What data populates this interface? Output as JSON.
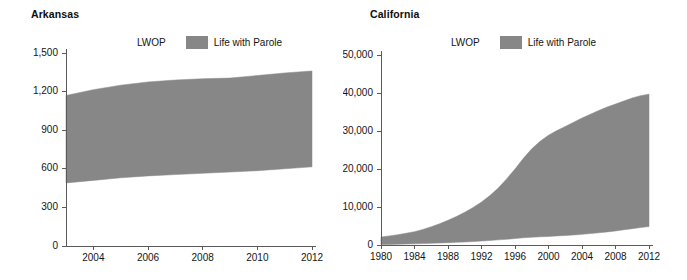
{
  "figure": {
    "background": "#ffffff",
    "series_color": "#878787",
    "axis_color": "#5a5a5a",
    "text_color": "#141414"
  },
  "panels": [
    {
      "id": "arkansas",
      "title": "Arkansas",
      "legend": {
        "lwop_label": "LWOP",
        "parole_label": "Life with Parole",
        "swatch_color": "#878787"
      }
    },
    {
      "id": "california",
      "title": "California",
      "legend": {
        "lwop_label": "LWOP",
        "parole_label": "Life with Parole",
        "swatch_color": "#878787"
      }
    }
  ],
  "chart_data": [
    {
      "type": "area",
      "title": "Arkansas",
      "xlabel": "",
      "ylabel": "",
      "grid": false,
      "legend_position": "top",
      "legend": [
        "LWOP",
        "Life with Parole"
      ],
      "series_color": "#878787",
      "xlim": [
        2003,
        2012
      ],
      "ylim": [
        0,
        1500
      ],
      "ytick_labels": [
        "0",
        "300",
        "600",
        "900",
        "1,200",
        "1,500"
      ],
      "ytick_values": [
        0,
        300,
        600,
        900,
        1200,
        1500
      ],
      "xtick_labels": [
        "2004",
        "2006",
        "2008",
        "2010",
        "2012"
      ],
      "xtick_values": [
        2004,
        2006,
        2008,
        2010,
        2012
      ],
      "x": [
        2003,
        2004,
        2005,
        2006,
        2007,
        2008,
        2009,
        2010,
        2011,
        2012
      ],
      "series": [
        {
          "name": "LWOP",
          "note": "lower boundary of shaded band; LWOP count",
          "values": [
            490,
            510,
            530,
            545,
            555,
            565,
            575,
            585,
            600,
            615
          ]
        },
        {
          "name": "Life with Parole",
          "note": "upper boundary of shaded band; LWOP + Life with Parole total",
          "values": [
            1170,
            1215,
            1250,
            1275,
            1290,
            1300,
            1305,
            1325,
            1345,
            1360
          ]
        }
      ]
    },
    {
      "type": "area",
      "title": "California",
      "xlabel": "",
      "ylabel": "",
      "grid": false,
      "legend_position": "top",
      "legend": [
        "LWOP",
        "Life with Parole"
      ],
      "series_color": "#878787",
      "xlim": [
        1980,
        2012
      ],
      "ylim": [
        0,
        50000
      ],
      "ytick_labels": [
        "0",
        "10,000",
        "20,000",
        "30,000",
        "40,000",
        "50,000"
      ],
      "ytick_values": [
        0,
        10000,
        20000,
        30000,
        40000,
        50000
      ],
      "xtick_labels": [
        "1980",
        "1984",
        "1988",
        "1992",
        "1996",
        "2000",
        "2004",
        "2008",
        "2012"
      ],
      "xtick_values": [
        1980,
        1984,
        1988,
        1992,
        1996,
        2000,
        2004,
        2008,
        2012
      ],
      "x": [
        1980,
        1981,
        1982,
        1983,
        1984,
        1985,
        1986,
        1987,
        1988,
        1989,
        1990,
        1991,
        1992,
        1993,
        1994,
        1995,
        1996,
        1997,
        1998,
        1999,
        2000,
        2001,
        2002,
        2003,
        2004,
        2005,
        2006,
        2007,
        2008,
        2009,
        2010,
        2011,
        2012
      ],
      "series": [
        {
          "name": "LWOP",
          "note": "lower boundary of shaded band; LWOP count",
          "values": [
            120,
            160,
            200,
            250,
            300,
            380,
            450,
            520,
            600,
            700,
            800,
            900,
            1050,
            1200,
            1350,
            1500,
            1700,
            1900,
            2050,
            2150,
            2250,
            2400,
            2500,
            2650,
            2800,
            3000,
            3200,
            3450,
            3700,
            4000,
            4300,
            4600,
            4850
          ]
        },
        {
          "name": "Life with Parole",
          "note": "upper boundary of shaded band; LWOP + Life with Parole total",
          "values": [
            2100,
            2400,
            2700,
            3100,
            3500,
            4100,
            4800,
            5600,
            6500,
            7500,
            8600,
            9900,
            11300,
            13000,
            15000,
            17400,
            20000,
            22800,
            25300,
            27300,
            28900,
            30100,
            31200,
            32300,
            33400,
            34400,
            35400,
            36300,
            37100,
            37900,
            38700,
            39300,
            39700
          ]
        }
      ]
    }
  ]
}
